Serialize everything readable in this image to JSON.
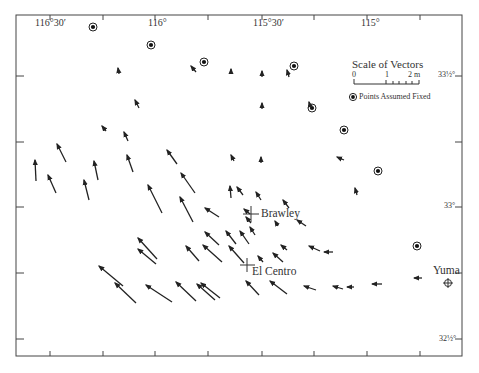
{
  "map": {
    "title": "",
    "longitude_labels": [
      {
        "text": "116°30′",
        "x": 35,
        "y": 24
      },
      {
        "text": "116°",
        "x": 148,
        "y": 24
      },
      {
        "text": "115°30′",
        "x": 253,
        "y": 24
      },
      {
        "text": "115°",
        "x": 362,
        "y": 24
      }
    ],
    "latitude_labels": [
      {
        "text": "33½°",
        "x": 440,
        "y": 73
      },
      {
        "text": "33°",
        "x": 446,
        "y": 205
      },
      {
        "text": "32½°",
        "x": 440,
        "y": 337
      }
    ],
    "places": [
      {
        "name": "Brawley",
        "x": 261,
        "y": 207,
        "mx": 251,
        "my": 214
      },
      {
        "name": "El Centro",
        "x": 253,
        "y": 263,
        "mx": 247,
        "my": 265
      },
      {
        "name": "Yuma",
        "x": 433,
        "y": 263
      }
    ],
    "yuma_marker": {
      "x": 448,
      "y": 283
    },
    "legend": {
      "scale_title": "Scale of Vectors",
      "scale_ticks": [
        "0",
        "1",
        "2 m"
      ],
      "fixed_label": "Points Assumed Fixed"
    },
    "fixed_points": [
      [
        93,
        27
      ],
      [
        151,
        45
      ],
      [
        204,
        62
      ],
      [
        294,
        66
      ],
      [
        312,
        108
      ],
      [
        344,
        130
      ],
      [
        378,
        171
      ],
      [
        417,
        246
      ]
    ],
    "vectors": [
      [
        119,
        74,
        118,
        68
      ],
      [
        196,
        72,
        191,
        66
      ],
      [
        231,
        74,
        231,
        69
      ],
      [
        139,
        108,
        135,
        100
      ],
      [
        106,
        131,
        102,
        126
      ],
      [
        128,
        141,
        124,
        132
      ],
      [
        262,
        77,
        262,
        71
      ],
      [
        289,
        77,
        287,
        70
      ],
      [
        262,
        109,
        262,
        103
      ],
      [
        311,
        109,
        309,
        102
      ],
      [
        66,
        162,
        57,
        144
      ],
      [
        36,
        181,
        35,
        160
      ],
      [
        56,
        193,
        48,
        175
      ],
      [
        98,
        180,
        94,
        161
      ],
      [
        89,
        200,
        84,
        180
      ],
      [
        133,
        172,
        127,
        155
      ],
      [
        177,
        164,
        167,
        150
      ],
      [
        234,
        161,
        231,
        155
      ],
      [
        261,
        163,
        261,
        157
      ],
      [
        231,
        198,
        230,
        186
      ],
      [
        195,
        193,
        181,
        173
      ],
      [
        162,
        213,
        148,
        185
      ],
      [
        193,
        222,
        180,
        197
      ],
      [
        219,
        217,
        205,
        208
      ],
      [
        243,
        195,
        237,
        187
      ],
      [
        261,
        200,
        256,
        192
      ],
      [
        357,
        195,
        355,
        188
      ],
      [
        344,
        160,
        337,
        157
      ],
      [
        306,
        226,
        297,
        220
      ],
      [
        250,
        214,
        244,
        209
      ],
      [
        251,
        223,
        246,
        217
      ],
      [
        278,
        226,
        275,
        221
      ],
      [
        289,
        208,
        283,
        200
      ],
      [
        157,
        259,
        138,
        238
      ],
      [
        156,
        264,
        138,
        249
      ],
      [
        199,
        261,
        186,
        246
      ],
      [
        219,
        245,
        205,
        232
      ],
      [
        222,
        262,
        203,
        245
      ],
      [
        236,
        244,
        226,
        231
      ],
      [
        244,
        263,
        229,
        246
      ],
      [
        249,
        244,
        240,
        231
      ],
      [
        255,
        235,
        250,
        227
      ],
      [
        263,
        262,
        258,
        256
      ],
      [
        283,
        262,
        273,
        253
      ],
      [
        287,
        250,
        281,
        245
      ],
      [
        320,
        251,
        309,
        246
      ],
      [
        333,
        252,
        324,
        252
      ],
      [
        123,
        286,
        99,
        266
      ],
      [
        136,
        303,
        115,
        283
      ],
      [
        172,
        302,
        146,
        285
      ],
      [
        196,
        301,
        176,
        282
      ],
      [
        215,
        300,
        197,
        284
      ],
      [
        220,
        298,
        201,
        283
      ],
      [
        259,
        295,
        246,
        281
      ],
      [
        287,
        294,
        270,
        281
      ],
      [
        316,
        290,
        304,
        286
      ],
      [
        343,
        289,
        333,
        286
      ],
      [
        354,
        287,
        347,
        287
      ],
      [
        382,
        284,
        372,
        284
      ],
      [
        422,
        278,
        414,
        278
      ]
    ]
  }
}
